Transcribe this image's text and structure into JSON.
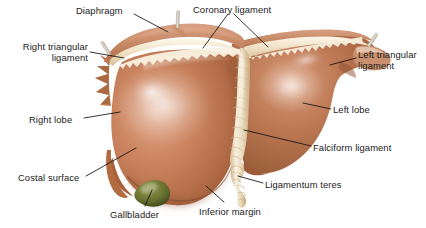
{
  "figure": {
    "background_color": "#ffffff",
    "width": 426,
    "height": 228
  },
  "palette": {
    "liver_light": "#d79a79",
    "liver_mid": "#c07a55",
    "liver_dark": "#a85f3c",
    "liver_deep": "#8f4d30",
    "liver_highlight": "#e6b396",
    "ligament_cream": "#f0e4cf",
    "ligament_cream_dark": "#d8c5a4",
    "gallbladder_green": "#6f7a33",
    "gallbladder_dark": "#4e5722",
    "leader_line": "#111111",
    "text": "#1a1a1a"
  },
  "labels": [
    {
      "id": "diaphragm",
      "text": "Diaphragm",
      "align": "left"
    },
    {
      "id": "coronary",
      "text": "Coronary ligament",
      "align": "left"
    },
    {
      "id": "right_triangular",
      "text": "Right triangular\nligament",
      "align": "right"
    },
    {
      "id": "left_triangular",
      "text": "Left triangular\nligament",
      "align": "left"
    },
    {
      "id": "right_lobe",
      "text": "Right lobe",
      "align": "left"
    },
    {
      "id": "left_lobe",
      "text": "Left lobe",
      "align": "left"
    },
    {
      "id": "costal_surface",
      "text": "Costal surface",
      "align": "left"
    },
    {
      "id": "falciform",
      "text": "Falciform ligament",
      "align": "left"
    },
    {
      "id": "ligamentum_teres",
      "text": "Ligamentum teres",
      "align": "left"
    },
    {
      "id": "gallbladder",
      "text": "Gallbladder",
      "align": "left"
    },
    {
      "id": "inferior_margin",
      "text": "Inferior margin",
      "align": "left"
    }
  ],
  "label_text": {
    "diaphragm": "Diaphragm",
    "coronary_ligament": "Coronary ligament",
    "right_triangular_ligament": "Right triangular\nligament",
    "left_triangular_ligament": "Left triangular\nligament",
    "right_lobe": "Right lobe",
    "left_lobe": "Left lobe",
    "costal_surface": "Costal surface",
    "falciform_ligament": "Falciform ligament",
    "ligamentum_teres": "Ligamentum teres",
    "gallbladder": "Gallbladder",
    "inferior_margin": "Inferior margin"
  },
  "structures": [
    {
      "name": "right-lobe",
      "color": "#c07a55"
    },
    {
      "name": "left-lobe",
      "color": "#b06f4d"
    },
    {
      "name": "falciform-ligament",
      "color": "#efe2ca"
    },
    {
      "name": "ligamentum-teres",
      "color": "#ead9bb"
    },
    {
      "name": "coronary-ligament",
      "color": "#f2e7d2"
    },
    {
      "name": "diaphragm",
      "color": "#cd8a66"
    },
    {
      "name": "gallbladder",
      "color": "#6f7a33"
    }
  ]
}
